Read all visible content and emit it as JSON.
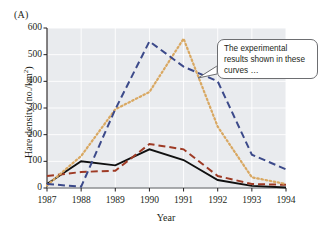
{
  "figure": {
    "panel_label": "(A)",
    "callout": {
      "text": "The experimental results shown in these curves …"
    }
  },
  "chart_data": {
    "type": "line",
    "title": "",
    "xlabel": "Year",
    "ylabel": "Hare density (no./km2)",
    "ylabel_base": "Hare density (no./km",
    "ylabel_exp": "2",
    "ylabel_tail": ")",
    "categories": [
      "1987",
      "1988",
      "1989",
      "1990",
      "1991",
      "1992",
      "1993",
      "1994"
    ],
    "x": [
      1987,
      1988,
      1989,
      1990,
      1991,
      1992,
      1993,
      1994
    ],
    "xlim": [
      1987,
      1994
    ],
    "ylim": [
      0,
      600
    ],
    "yticks": [
      600,
      500,
      400,
      300,
      200,
      100,
      0
    ],
    "ytick_labels": [
      "600",
      "500",
      "400",
      "300",
      "200",
      "100",
      "0"
    ],
    "grid": true,
    "legend_position": "none",
    "plot_background": "#e9ebee",
    "series": [
      {
        "name": "black-solid",
        "style": "solid",
        "color": "#101010",
        "width": 1.9,
        "values": [
          15,
          100,
          85,
          145,
          105,
          30,
          8,
          2
        ]
      },
      {
        "name": "red-brown-dashed",
        "style": "dashed",
        "color": "#9e3a24",
        "width": 2.0,
        "values": [
          45,
          60,
          65,
          165,
          145,
          45,
          15,
          12
        ]
      },
      {
        "name": "tan-dotted",
        "style": "dotted",
        "color": "#d9a862",
        "width": 2.2,
        "values": [
          10,
          120,
          295,
          360,
          560,
          230,
          40,
          15
        ]
      },
      {
        "name": "navy-dashed",
        "style": "dashed",
        "color": "#3c4a8a",
        "width": 2.0,
        "values": [
          15,
          5,
          295,
          550,
          455,
          400,
          125,
          70
        ]
      }
    ]
  }
}
